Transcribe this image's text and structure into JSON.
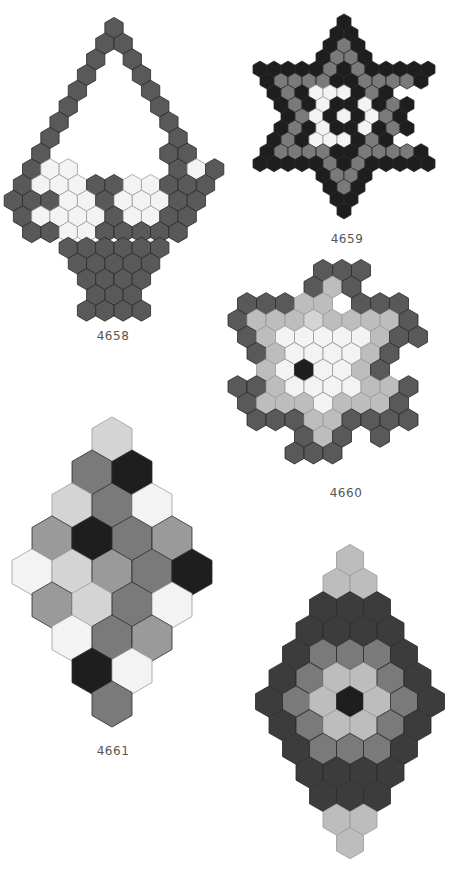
{
  "palette": {
    "K": "#1e1e1e",
    "D": "#595959",
    "N": "#3c3c3c",
    "M": "#7a7a7a",
    "G": "#9a9a9a",
    "L": "#bdbdbd",
    "P": "#d4d4d4",
    "W": "#f3f3f3",
    "stroke": "#2a2a2a",
    "stroke_light": "#9a9a9a"
  },
  "patterns": [
    {
      "id": "4658",
      "label": "4658",
      "label_pos": [
        113,
        337
      ],
      "origin": [
        114,
        28
      ],
      "hex_w": 18.3,
      "row_h": 15.7,
      "rows": [
        {
          "o": 0,
          "c": "D"
        },
        {
          "o": -1,
          "c": "DD"
        },
        {
          "o": -2,
          "c": "D.D"
        },
        {
          "o": -3,
          "c": "D..D"
        },
        {
          "o": -4,
          "c": "D...D"
        },
        {
          "o": -5,
          "c": "D....D"
        },
        {
          "o": -6,
          "c": "D.....D"
        },
        {
          "o": -7,
          "c": "D......D"
        },
        {
          "o": -8,
          "c": "D......DD"
        },
        {
          "o": -9,
          "c": "DWW.....DWD"
        },
        {
          "o": -10,
          "c": "DWWWDDWWDDD"
        },
        {
          "o": -11,
          "c": "DDDWWDWWWDD"
        },
        {
          "o": -10,
          "c": "DWWWWDWWDD"
        },
        {
          "o": -9,
          "c": "DDWWDDDDD"
        },
        {
          "o": -5,
          "c": "DDDDDD"
        },
        {
          "o": -4,
          "c": "DDDDD"
        },
        {
          "o": -3,
          "c": "DDDD"
        },
        {
          "o": -2,
          "c": "DDD"
        },
        {
          "o": -3,
          "c": "DDDD"
        }
      ]
    },
    {
      "id": "4659",
      "label": "4659",
      "label_pos": [
        347,
        240
      ],
      "origin": [
        344,
        22
      ],
      "hex_w": 14,
      "row_h": 11.8,
      "rows": [
        {
          "o": 0,
          "c": "K"
        },
        {
          "o": -1,
          "c": "KK"
        },
        {
          "o": -2,
          "c": "KMK"
        },
        {
          "o": -3,
          "c": "KMMK"
        },
        {
          "o": -12,
          "c": "KKKKKMKMKKKKK"
        },
        {
          "o": -11,
          "c": "KMMMMKKMMMMK"
        },
        {
          "o": -10,
          "c": "KMKWWWKMK"
        },
        {
          "o": -9,
          "c": "KMKWKKWKMK"
        },
        {
          "o": -8,
          "c": "KMWKWKWMK"
        },
        {
          "o": -9,
          "c": "KMKWKKWKMK"
        },
        {
          "o": -10,
          "c": "KMKWWWKMK"
        },
        {
          "o": -11,
          "c": "KMMMMKKMMMMK"
        },
        {
          "o": -12,
          "c": "KKKKKMKMKKKKK"
        },
        {
          "o": -3,
          "c": "KMMK"
        },
        {
          "o": -2,
          "c": "KMK"
        },
        {
          "o": -1,
          "c": "KK"
        },
        {
          "o": 0,
          "c": "K"
        }
      ]
    },
    {
      "id": "4660",
      "label": "4660",
      "label_pos": [
        346,
        494
      ],
      "origin": [
        342,
        370
      ],
      "hex_w": 19,
      "row_h": 16.6,
      "rows": [
        {
          "o": -2,
          "dy": -6,
          "c": "DDD"
        },
        {
          "o": -3,
          "dy": -5,
          "c": "DLD"
        },
        {
          "o": -10,
          "dy": -4,
          "c": "DDDLL.DDD"
        },
        {
          "o": -11,
          "dy": -3,
          "c": "DLLLPLLLLD"
        },
        {
          "o": -10,
          "dy": -2,
          "c": "DLWWWWWLDD"
        },
        {
          "o": -9,
          "dy": -1,
          "c": "DLWWWWLD"
        },
        {
          "o": -8,
          "dy": 0,
          "c": "LWKWWLD"
        },
        {
          "o": -11,
          "dy": 1,
          "c": "DDLWWWWLLD"
        },
        {
          "o": -10,
          "dy": 2,
          "c": "DLLLWLLLD"
        },
        {
          "o": -9,
          "dy": 3,
          "c": "DDDLLDDDD"
        },
        {
          "o": -4,
          "dy": 4,
          "c": "DLD.D"
        },
        {
          "o": -5,
          "dy": 5,
          "c": "DDD"
        }
      ]
    },
    {
      "id": "4661",
      "label": "4661",
      "label_pos": [
        113,
        752
      ],
      "origin": [
        112,
        440
      ],
      "hex_w": 40,
      "row_h": 33,
      "rows": [
        {
          "o": 0,
          "c": "P"
        },
        {
          "o": -1,
          "c": "MK"
        },
        {
          "o": -2,
          "c": "PMW"
        },
        {
          "o": -3,
          "c": "GKMG"
        },
        {
          "o": -4,
          "c": "WPGMK"
        },
        {
          "o": -3,
          "c": "GPMW"
        },
        {
          "o": -2,
          "c": "WMG"
        },
        {
          "o": -1,
          "c": "KW"
        },
        {
          "o": 0,
          "c": "M"
        }
      ]
    },
    {
      "id": "4662",
      "label": "4662",
      "label_pos": null,
      "origin": [
        350,
        560
      ],
      "hex_w": 27,
      "row_h": 23.6,
      "rows": [
        {
          "o": 0,
          "c": "L"
        },
        {
          "o": -1,
          "c": "LL"
        },
        {
          "o": -2,
          "c": "NNN"
        },
        {
          "o": -3,
          "c": "NNNN"
        },
        {
          "o": -4,
          "c": "NMMMN"
        },
        {
          "o": -5,
          "c": "NMLLMN"
        },
        {
          "o": -6,
          "c": "NMLKLMN"
        },
        {
          "o": -5,
          "c": "NMLLMN"
        },
        {
          "o": -4,
          "c": "NMMMN"
        },
        {
          "o": -3,
          "c": "NNNN"
        },
        {
          "o": -2,
          "c": "NNN"
        },
        {
          "o": -1,
          "c": "LL"
        },
        {
          "o": 0,
          "c": "L"
        }
      ]
    }
  ]
}
